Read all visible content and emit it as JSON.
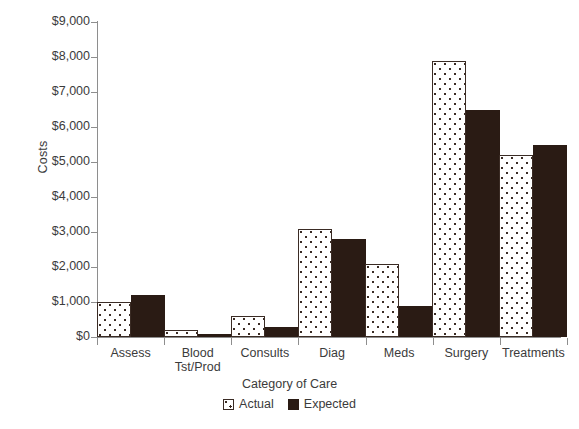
{
  "chart_data": {
    "type": "bar",
    "title": "",
    "xlabel": "Category of Care",
    "ylabel": "Costs",
    "categories": [
      "Assess",
      "Blood Tst/Prod",
      "Consults",
      "Diag",
      "Meds",
      "Surgery",
      "Treatments"
    ],
    "category_lines": [
      [
        "Assess"
      ],
      [
        "Blood",
        "Tst/Prod"
      ],
      [
        "Consults"
      ],
      [
        "Diag"
      ],
      [
        "Meds"
      ],
      [
        "Surgery"
      ],
      [
        "Treatments"
      ]
    ],
    "series": [
      {
        "name": "Actual",
        "values": [
          1000,
          200,
          600,
          3100,
          2100,
          7900,
          5200
        ]
      },
      {
        "name": "Expected",
        "values": [
          1200,
          100,
          300,
          2800,
          900,
          6500,
          5500
        ]
      }
    ],
    "ylim": [
      0,
      9000
    ],
    "ytick_values": [
      0,
      1000,
      2000,
      3000,
      4000,
      5000,
      6000,
      7000,
      8000,
      9000
    ],
    "ytick_labels": [
      "$0",
      "$1,000",
      "$2,000",
      "$3,000",
      "$4,000",
      "$5,000",
      "$6,000",
      "$7,000",
      "$8,000",
      "$9,000"
    ],
    "grid": false,
    "legend_position": "bottom-center",
    "colors": {
      "actual_fill": "#ffffff",
      "actual_pattern": "#3a2b24",
      "expected_fill": "#2a1b14",
      "axis": "#8e8e8e",
      "text": "#3b3b3b",
      "background": "#ffffff"
    }
  },
  "legend": {
    "items": [
      {
        "label": "Actual",
        "swatch": "dotted-pattern-swatch"
      },
      {
        "label": "Expected",
        "swatch": "solid-dark-swatch"
      }
    ]
  }
}
